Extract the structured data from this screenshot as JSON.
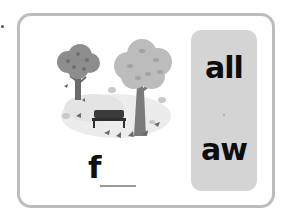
{
  "card": {
    "image": {
      "icon": "autumn-park-icon",
      "description": "park with two autumn trees, a bench and falling leaves"
    },
    "word": {
      "first_letter": "f",
      "blank": "___"
    },
    "choices": [
      {
        "label": "all"
      },
      {
        "label": "aw"
      }
    ]
  },
  "colors": {
    "card_border": "#bdbdbd",
    "panel_bg": "#d4d4d4",
    "text": "#111111"
  }
}
